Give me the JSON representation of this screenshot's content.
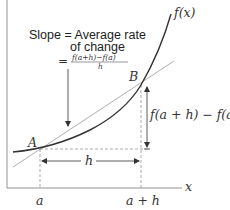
{
  "diagram": {
    "title_lines": {
      "line1": "Slope = Average rate",
      "line2": "of change",
      "equals": "=",
      "numerator": "f(a+h)−f(a)",
      "denominator": "h"
    },
    "curve_label": "f(x)",
    "point_a_label": "A",
    "point_b_label": "B",
    "vertical_change_label": "f(a + h) − f(a)",
    "horizontal_change_label": "h",
    "x_axis_label": "x",
    "tick_a_label": "a",
    "tick_a_plus_h_label": "a + h",
    "colors": {
      "curve": "#333333",
      "secant": "#999999",
      "axes": "#666666",
      "dashed": "#888888",
      "arrow": "#333333"
    }
  }
}
